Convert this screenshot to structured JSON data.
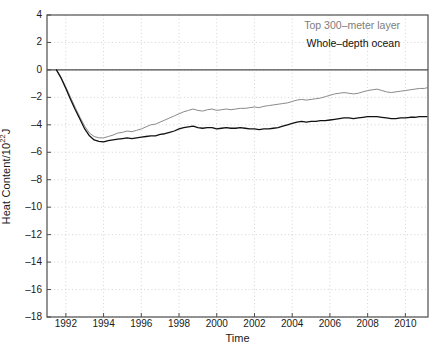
{
  "chart_data": {
    "type": "line",
    "title": "",
    "xlabel": "Time",
    "ylabel": "Heat Content/10",
    "ylabel_sup": "22",
    "ylabel_suffix": "J",
    "xlim": [
      1991.0,
      2011.2
    ],
    "ylim": [
      -18,
      4
    ],
    "xticks": [
      1992,
      1994,
      1996,
      1998,
      2000,
      2002,
      2004,
      2006,
      2008,
      2010
    ],
    "yticks": [
      4,
      2,
      0,
      -2,
      -4,
      -6,
      -8,
      -10,
      -12,
      -14,
      -16,
      -18
    ],
    "grid": true,
    "grid_style": "dotted",
    "legend_position": "top-right-inside",
    "colors": {
      "top300": "#8a8a8a",
      "whole": "#111111",
      "axis": "#4d4d4d",
      "grid": "#c9c9c9",
      "background": "#ffffff"
    },
    "series": [
      {
        "name": "Top 300-meter layer",
        "color": "#8a8a8a",
        "x": [
          1991.5,
          1991.75,
          1992.0,
          1992.25,
          1992.5,
          1992.75,
          1993.0,
          1993.25,
          1993.5,
          1993.75,
          1994.0,
          1994.25,
          1994.5,
          1994.75,
          1995.0,
          1995.25,
          1995.5,
          1995.75,
          1996.0,
          1996.25,
          1996.5,
          1996.75,
          1997.0,
          1997.25,
          1997.5,
          1997.75,
          1998.0,
          1998.25,
          1998.5,
          1998.75,
          1999.0,
          1999.25,
          1999.5,
          1999.75,
          2000.0,
          2000.25,
          2000.5,
          2000.75,
          2001.0,
          2001.25,
          2001.5,
          2001.75,
          2002.0,
          2002.25,
          2002.5,
          2002.75,
          2003.0,
          2003.25,
          2003.5,
          2003.75,
          2004.0,
          2004.25,
          2004.5,
          2004.75,
          2005.0,
          2005.25,
          2005.5,
          2005.75,
          2006.0,
          2006.25,
          2006.5,
          2006.75,
          2007.0,
          2007.25,
          2007.5,
          2007.75,
          2008.0,
          2008.25,
          2008.5,
          2008.75,
          2009.0,
          2009.25,
          2009.5,
          2009.75,
          2010.0,
          2010.25,
          2010.5,
          2010.75,
          2011.0,
          2011.15
        ],
        "y": [
          0.0,
          -0.55,
          -1.25,
          -2.0,
          -2.75,
          -3.45,
          -4.1,
          -4.6,
          -4.85,
          -4.95,
          -4.95,
          -4.85,
          -4.75,
          -4.6,
          -4.55,
          -4.45,
          -4.5,
          -4.4,
          -4.3,
          -4.15,
          -4.0,
          -3.95,
          -3.8,
          -3.65,
          -3.5,
          -3.35,
          -3.2,
          -3.05,
          -2.95,
          -2.85,
          -2.95,
          -3.0,
          -2.9,
          -2.85,
          -2.95,
          -2.9,
          -2.85,
          -2.9,
          -2.85,
          -2.8,
          -2.8,
          -2.75,
          -2.7,
          -2.75,
          -2.65,
          -2.6,
          -2.55,
          -2.5,
          -2.45,
          -2.4,
          -2.3,
          -2.2,
          -2.15,
          -2.2,
          -2.15,
          -2.1,
          -2.05,
          -1.95,
          -1.85,
          -1.75,
          -1.7,
          -1.65,
          -1.7,
          -1.75,
          -1.7,
          -1.6,
          -1.5,
          -1.45,
          -1.4,
          -1.5,
          -1.6,
          -1.65,
          -1.6,
          -1.55,
          -1.5,
          -1.45,
          -1.4,
          -1.35,
          -1.35,
          -1.3
        ]
      },
      {
        "name": "Whole-depth ocean",
        "color": "#111111",
        "x": [
          1991.5,
          1991.75,
          1992.0,
          1992.25,
          1992.5,
          1992.75,
          1993.0,
          1993.25,
          1993.5,
          1993.75,
          1994.0,
          1994.25,
          1994.5,
          1994.75,
          1995.0,
          1995.25,
          1995.5,
          1995.75,
          1996.0,
          1996.25,
          1996.5,
          1996.75,
          1997.0,
          1997.25,
          1997.5,
          1997.75,
          1998.0,
          1998.25,
          1998.5,
          1998.75,
          1999.0,
          1999.25,
          1999.5,
          1999.75,
          2000.0,
          2000.25,
          2000.5,
          2000.75,
          2001.0,
          2001.25,
          2001.5,
          2001.75,
          2002.0,
          2002.25,
          2002.5,
          2002.75,
          2003.0,
          2003.25,
          2003.5,
          2003.75,
          2004.0,
          2004.25,
          2004.5,
          2004.75,
          2005.0,
          2005.25,
          2005.5,
          2005.75,
          2006.0,
          2006.25,
          2006.5,
          2006.75,
          2007.0,
          2007.25,
          2007.5,
          2007.75,
          2008.0,
          2008.25,
          2008.5,
          2008.75,
          2009.0,
          2009.25,
          2009.5,
          2009.75,
          2010.0,
          2010.25,
          2010.5,
          2010.75,
          2011.0,
          2011.15
        ],
        "y": [
          0.0,
          -0.6,
          -1.35,
          -2.15,
          -2.9,
          -3.6,
          -4.3,
          -4.8,
          -5.1,
          -5.2,
          -5.25,
          -5.15,
          -5.1,
          -5.05,
          -5.0,
          -4.95,
          -5.0,
          -4.95,
          -4.9,
          -4.85,
          -4.8,
          -4.8,
          -4.7,
          -4.65,
          -4.55,
          -4.45,
          -4.3,
          -4.2,
          -4.15,
          -4.1,
          -4.2,
          -4.25,
          -4.2,
          -4.2,
          -4.3,
          -4.25,
          -4.2,
          -4.25,
          -4.25,
          -4.2,
          -4.25,
          -4.3,
          -4.3,
          -4.35,
          -4.3,
          -4.3,
          -4.25,
          -4.2,
          -4.1,
          -4.0,
          -3.9,
          -3.8,
          -3.75,
          -3.8,
          -3.75,
          -3.75,
          -3.7,
          -3.7,
          -3.65,
          -3.6,
          -3.55,
          -3.5,
          -3.5,
          -3.55,
          -3.5,
          -3.45,
          -3.4,
          -3.4,
          -3.4,
          -3.45,
          -3.5,
          -3.55,
          -3.55,
          -3.5,
          -3.5,
          -3.45,
          -3.45,
          -3.4,
          -3.4,
          -3.4
        ]
      }
    ]
  },
  "legend": {
    "top300_label": "Top 300–meter layer",
    "whole_label": "Whole–depth ocean"
  },
  "axes": {
    "xlabel": "Time",
    "ylabel_prefix": "Heat Content/10",
    "ylabel_exponent": "22",
    "ylabel_unit": "J"
  }
}
